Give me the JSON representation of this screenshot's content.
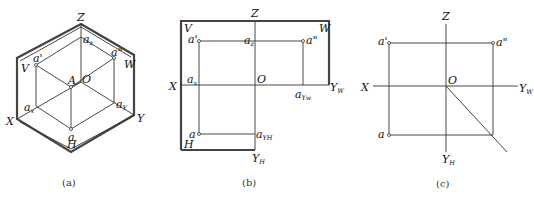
{
  "figures": [
    {
      "id": "a",
      "caption": "(a)",
      "description": "Isometric view of three projection planes V, H, W with point A and its projections",
      "labels": {
        "Z": "Z",
        "X": "X",
        "Y": "Y",
        "O": "O",
        "A": "A",
        "V": "V",
        "W": "W",
        "H": "H",
        "a_prime": "a'",
        "a_double_prime": "a\"",
        "a": "a",
        "a_z": "a",
        "a_z_sub": "z",
        "a_x": "a",
        "a_x_sub": "x",
        "a_y": "a",
        "a_y_sub": "Y"
      }
    },
    {
      "id": "b",
      "caption": "(b)",
      "description": "Unfolded projection planes with plane boundaries",
      "labels": {
        "Z": "Z",
        "X": "X",
        "O": "O",
        "V": "V",
        "W": "W",
        "H": "H",
        "Y_W": "Y",
        "Y_W_sub": "W",
        "Y_H": "Y",
        "Y_H_sub": "H",
        "a_prime": "a'",
        "a_double_prime": "a\"",
        "a": "a",
        "a_z": "a",
        "a_z_sub": "z",
        "a_x": "a",
        "a_x_sub": "x",
        "a_yw": "a",
        "a_yw_sub": "Yw",
        "a_yh": "a",
        "a_yh_sub": "YH"
      }
    },
    {
      "id": "c",
      "caption": "(c)",
      "description": "Three-view projection of point A with 45-degree auxiliary line",
      "labels": {
        "Z": "Z",
        "X": "X",
        "O": "O",
        "Y_W": "Y",
        "Y_W_sub": "W",
        "Y_H": "Y",
        "Y_H_sub": "H",
        "a_prime": "a'",
        "a_double_prime": "a\"",
        "a": "a"
      }
    }
  ]
}
